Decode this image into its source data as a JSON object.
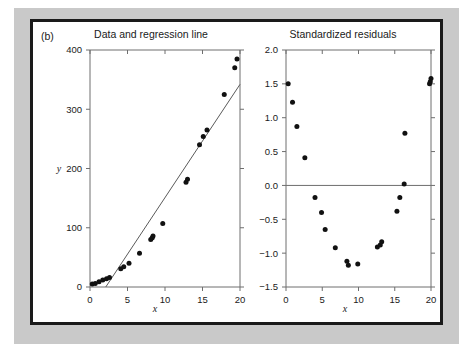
{
  "figure": {
    "panel_label": "(b)",
    "background_color": "#c9c9c9",
    "card_color": "#ffffff",
    "border_color": "#1a1a1a",
    "point_color": "#111111",
    "line_color": "#5a5a5a",
    "axis_color": "#6e6e6e"
  },
  "chart_data": [
    {
      "type": "scatter",
      "id": "data-and-regression",
      "title": "Data and regression line",
      "xlabel": "x",
      "ylabel": "y",
      "xlim": [
        0,
        20
      ],
      "ylim": [
        0,
        400
      ],
      "xticks": [
        0,
        5,
        10,
        15,
        20
      ],
      "xticklabels": [
        "0",
        "5",
        "10",
        "15",
        "20"
      ],
      "yticks": [
        0,
        100,
        200,
        300,
        400
      ],
      "yticklabels": [
        "0",
        "100",
        "200",
        "300",
        "400"
      ],
      "grid": false,
      "legend": false,
      "x": [
        0.3,
        0.7,
        1.2,
        1.7,
        2.2,
        2.6,
        4.1,
        4.5,
        5.2,
        6.6,
        8.1,
        8.3,
        8.4,
        9.7,
        12.8,
        13.0,
        14.6,
        15.1,
        15.6,
        17.9,
        19.3,
        19.6
      ],
      "y": [
        5,
        6,
        9,
        12,
        14,
        16,
        31,
        34,
        40,
        57,
        80,
        83,
        86,
        107,
        177,
        182,
        240,
        254,
        265,
        325,
        370,
        385
      ],
      "regression_line": {
        "label": "regression line",
        "x_endpoints": [
          2.1,
          20.0
        ],
        "y_endpoints": [
          0,
          342
        ],
        "slope": 19.1,
        "intercept": -40.1
      }
    },
    {
      "type": "scatter",
      "id": "standardized-residuals",
      "title": "Standardized residuals",
      "xlabel": "x",
      "ylabel": "",
      "xlim": [
        0,
        20
      ],
      "ylim": [
        -1.5,
        2.0
      ],
      "xticks": [
        0,
        5,
        10,
        15,
        20
      ],
      "xticklabels": [
        "0",
        "5",
        "10",
        "15",
        "20"
      ],
      "yticks": [
        -1.5,
        -1.0,
        -0.5,
        0.0,
        0.5,
        1.0,
        1.5,
        2.0
      ],
      "yticklabels": [
        "-1.5",
        "-1.0",
        "-0.5",
        "0.0",
        "0.5",
        "1.0",
        "1.5",
        "2.0"
      ],
      "grid": false,
      "legend": false,
      "reference_line_y": 0.0,
      "x": [
        0.3,
        0.9,
        1.5,
        2.6,
        4.0,
        4.9,
        5.4,
        6.8,
        8.4,
        8.6,
        9.9,
        12.6,
        13.0,
        13.2,
        15.3,
        15.7,
        16.3,
        16.4,
        19.8,
        19.9,
        20.0
      ],
      "y": [
        1.5,
        1.23,
        0.87,
        0.41,
        -0.18,
        -0.4,
        -0.65,
        -0.92,
        -1.12,
        -1.18,
        -1.16,
        -0.91,
        -0.88,
        -0.83,
        -0.38,
        -0.18,
        0.02,
        0.77,
        1.5,
        1.53,
        1.58
      ]
    }
  ]
}
